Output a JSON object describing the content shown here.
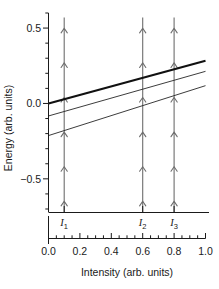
{
  "chart_data": {
    "type": "line",
    "title": "",
    "xlabel": "Intensity (arb. units)",
    "ylabel": "Energy (arb. units)",
    "xlim": [
      0.0,
      1.0
    ],
    "ylim": [
      -0.72,
      0.6
    ],
    "grid": false,
    "legend": null,
    "xticks": [
      0.0,
      0.2,
      0.4,
      0.6,
      0.8,
      1.0
    ],
    "xticklabels": [
      "0.0",
      "0.2",
      "0.4",
      "0.6",
      "0.8",
      "1.0"
    ],
    "xminor_step": 0.05,
    "yticks": [
      0.5,
      0.0,
      -0.5
    ],
    "yticklabels": [
      "0.5",
      "0.0",
      "−0.5"
    ],
    "yminor_step": 0.1,
    "series": [
      {
        "name": "upper-branch",
        "emphasis": "bold",
        "linewidth": 2.2,
        "x": [
          0.0,
          1.0
        ],
        "y": [
          0.0,
          0.283
        ]
      },
      {
        "name": "middle-branch",
        "emphasis": "normal",
        "linewidth": 0.9,
        "x": [
          0.0,
          1.0
        ],
        "y": [
          -0.083,
          0.213
        ]
      },
      {
        "name": "lower-branch",
        "emphasis": "normal",
        "linewidth": 0.9,
        "x": [
          0.0,
          1.0
        ],
        "y": [
          -0.213,
          0.118
        ]
      }
    ],
    "annotations": [
      {
        "name": "intensity-marker-1",
        "label": "I",
        "subscript": "1",
        "x": 0.1,
        "arrow_direction": "up",
        "arrow_count": 6,
        "y_start": -0.72,
        "y_end": 0.57
      },
      {
        "name": "intensity-marker-2",
        "label": "I",
        "subscript": "2",
        "x": 0.6,
        "arrow_direction": "up",
        "arrow_count": 6,
        "y_start": -0.72,
        "y_end": 0.57
      },
      {
        "name": "intensity-marker-3",
        "label": "I",
        "subscript": "3",
        "x": 0.8,
        "arrow_direction": "up",
        "arrow_count": 6,
        "y_start": -0.72,
        "y_end": 0.57
      }
    ],
    "colors": {
      "line": "#262626",
      "bold_line": "#111111",
      "arrow": "#6e6e6e",
      "axis": "#1a1a1a",
      "background": "#ffffff"
    }
  }
}
